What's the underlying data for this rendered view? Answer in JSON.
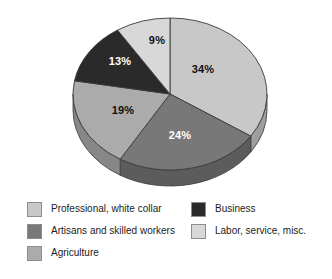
{
  "chart_data": {
    "type": "pie",
    "title": "",
    "subtitle": "",
    "xlabel": "",
    "ylabel": "",
    "grid": false,
    "legend_position": "bottom",
    "three_d": true,
    "start_angle_deg": 0,
    "direction": "clockwise",
    "categories": [
      "Professional, white collar",
      "Artisans and skilled workers",
      "Agriculture",
      "Business",
      "Labor, service, misc."
    ],
    "values": [
      34,
      24,
      19,
      13,
      9
    ],
    "data_labels": [
      "34%",
      "24%",
      "19%",
      "13%",
      "9%"
    ],
    "colors": [
      "#c8c8c8",
      "#787878",
      "#ababab",
      "#2a2a2a",
      "#d8d8d8"
    ],
    "slices": [
      {
        "label": "Professional, white collar",
        "value": 34,
        "data_label": "34%",
        "color": "#c8c8c8",
        "side_color": "#9e9e9e",
        "label_color": "dark",
        "label_x": 203,
        "label_y": 73
      },
      {
        "label": "Artisans and skilled workers",
        "value": 24,
        "data_label": "24%",
        "color": "#787878",
        "side_color": "#5c5c5c",
        "label_color": "light",
        "label_x": 180,
        "label_y": 139
      },
      {
        "label": "Agriculture",
        "value": 19,
        "data_label": "19%",
        "color": "#ababab",
        "side_color": "#878787",
        "label_color": "dark",
        "label_x": 123,
        "label_y": 114
      },
      {
        "label": "Business",
        "value": 13,
        "data_label": "13%",
        "color": "#2a2a2a",
        "side_color": "#1d1d1d",
        "label_color": "light",
        "label_x": 120,
        "label_y": 65
      },
      {
        "label": "Labor, service, misc.",
        "value": 9,
        "data_label": "9%",
        "color": "#d8d8d8",
        "side_color": "#aeaeae",
        "label_color": "dark",
        "label_x": 157,
        "label_y": 44
      }
    ]
  },
  "legend": {
    "columns": [
      {
        "items": [
          {
            "label": "Professional, white collar",
            "color": "#c8c8c8"
          },
          {
            "label": "Artisans and skilled workers",
            "color": "#787878"
          },
          {
            "label": "Agriculture",
            "color": "#ababab"
          }
        ]
      },
      {
        "items": [
          {
            "label": "Business",
            "color": "#2a2a2a"
          },
          {
            "label": "Labor, service, misc.",
            "color": "#d8d8d8"
          }
        ]
      }
    ]
  }
}
